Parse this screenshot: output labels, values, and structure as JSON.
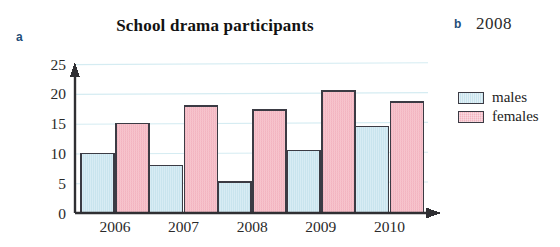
{
  "parts": {
    "a_label": "a",
    "b_label": "b",
    "b_answer": "2008"
  },
  "chart_data": {
    "type": "bar",
    "title": "School drama participants",
    "xlabel": "",
    "ylabel": "",
    "categories": [
      "2006",
      "2007",
      "2008",
      "2009",
      "2010"
    ],
    "series": [
      {
        "name": "males",
        "color": "#c9e4ee",
        "values": [
          10,
          8,
          5.2,
          10.5,
          14.5
        ]
      },
      {
        "name": "females",
        "color": "#f2b4c0",
        "values": [
          15,
          18,
          17.3,
          20.5,
          18.6
        ]
      }
    ],
    "ylim": [
      0,
      25
    ],
    "yticks": [
      0,
      5,
      10,
      15,
      20,
      25
    ],
    "ytick_labels": [
      "0",
      "5",
      "10",
      "15",
      "20",
      "25"
    ],
    "grid": true,
    "grid_color": "#d5ecf2",
    "legend_position": "right",
    "axis_color": "#2f2f33",
    "bar_border_color": "#3b3b44"
  }
}
